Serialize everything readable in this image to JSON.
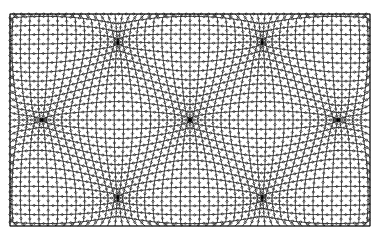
{
  "artwork": {
    "kind": "op-art warped lattice pattern",
    "background": "#ffffff",
    "stroke": "#000000",
    "bounds": {
      "x0": 10,
      "y0": 14,
      "x1": 370,
      "y1": 226
    },
    "grid_step": 7.5,
    "bulges": [
      [
        45,
        45
      ],
      [
        190,
        45
      ],
      [
        335,
        45
      ],
      [
        118,
        120
      ],
      [
        262,
        120
      ],
      [
        45,
        195
      ],
      [
        190,
        195
      ],
      [
        335,
        195
      ]
    ],
    "pinches": [
      [
        118,
        45
      ],
      [
        262,
        45
      ],
      [
        45,
        120
      ],
      [
        190,
        120
      ],
      [
        335,
        120
      ],
      [
        118,
        195
      ],
      [
        262,
        195
      ]
    ]
  }
}
